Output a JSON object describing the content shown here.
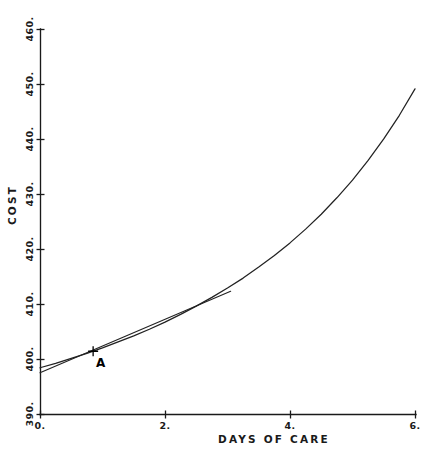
{
  "chart_data": {
    "type": "line",
    "title": "",
    "xlabel": "DAYS OF CARE",
    "ylabel": "COST",
    "xlim": [
      0,
      6
    ],
    "ylim": [
      390,
      460
    ],
    "grid": false,
    "legend": "none",
    "x_ticks": [
      {
        "value": 0,
        "label": "0."
      },
      {
        "value": 2,
        "label": "2."
      },
      {
        "value": 4,
        "label": "4."
      },
      {
        "value": 6,
        "label": "6."
      }
    ],
    "x_minor_ticks": [
      1,
      3,
      5
    ],
    "y_ticks": [
      {
        "value": 390,
        "label": "390."
      },
      {
        "value": 400,
        "label": "400."
      },
      {
        "value": 410,
        "label": "410."
      },
      {
        "value": 420,
        "label": "420."
      },
      {
        "value": 430,
        "label": "430."
      },
      {
        "value": 440,
        "label": "440."
      },
      {
        "value": 450,
        "label": "450."
      },
      {
        "value": 460,
        "label": "460."
      }
    ],
    "series": [
      {
        "name": "cost-curve",
        "type": "line",
        "x": [
          0.0,
          0.25,
          0.5,
          0.75,
          1.0,
          1.25,
          1.5,
          1.75,
          2.0,
          2.25,
          2.5,
          2.75,
          3.0,
          3.25,
          3.5,
          3.75,
          4.0,
          4.25,
          4.5,
          4.75,
          5.0,
          5.25,
          5.5,
          5.75,
          6.0
        ],
        "y": [
          398.5,
          399.3,
          400.2,
          401.1,
          402.1,
          403.2,
          404.3,
          405.5,
          406.8,
          408.2,
          409.7,
          411.3,
          413.0,
          414.8,
          416.8,
          418.9,
          421.2,
          423.7,
          426.4,
          429.4,
          432.6,
          436.2,
          440.1,
          444.4,
          449.2
        ]
      },
      {
        "name": "tangent-line-at-A",
        "type": "line",
        "x": [
          0.0,
          3.05
        ],
        "y": [
          397.6,
          412.4
        ]
      }
    ],
    "annotations": [
      {
        "name": "point-A",
        "label": "A",
        "marker": "plus",
        "x": 0.85,
        "y": 401.5,
        "label_offset_x": 0.12,
        "label_offset_y": -2.2
      }
    ]
  },
  "colors": {
    "curve": "#222222",
    "tangent": "#222222",
    "axis": "#1a1a1a",
    "text": "#1a1a1a",
    "background": "#ffffff"
  }
}
